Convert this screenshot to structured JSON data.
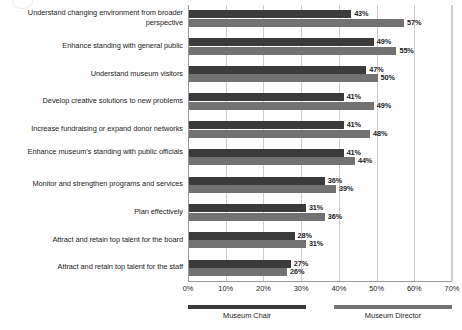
{
  "chart_data": {
    "type": "bar",
    "orientation": "horizontal",
    "title": "",
    "xlabel": "",
    "ylabel": "",
    "xlim": [
      0,
      70
    ],
    "xticks": [
      "0%",
      "10%",
      "20%",
      "30%",
      "40%",
      "50%",
      "60%",
      "70%"
    ],
    "grid": true,
    "legend_position": "bottom",
    "categories": [
      "Understand changing environment from broader perspective",
      "Enhance standing with general public",
      "Understand museum visitors",
      "Develop creative solutions to new problems",
      "Increase fundraising or expand donor networks",
      "Enhance museum's standing with public officials",
      "Monitor and strengthen programs and services",
      "Plan effectively",
      "Attract and retain top talent for the board",
      "Attract and retain top talent for the staff"
    ],
    "series": [
      {
        "name": "Museum Chair",
        "color": "#3b3b3b",
        "values": [
          43,
          49,
          47,
          41,
          41,
          41,
          36,
          31,
          28,
          27
        ],
        "labels": [
          "43%",
          "49%",
          "47%",
          "41%",
          "41%",
          "41%",
          "36%",
          "31%",
          "28%",
          "27%"
        ]
      },
      {
        "name": "Museum Director",
        "color": "#727272",
        "values": [
          57,
          55,
          50,
          49,
          48,
          44,
          39,
          36,
          31,
          26
        ],
        "labels": [
          "57%",
          "55%",
          "50%",
          "49%",
          "48%",
          "44%",
          "39%",
          "36%",
          "31%",
          "26%"
        ]
      }
    ]
  },
  "legend": [
    {
      "label": "Museum Chair",
      "color": "#3b3b3b"
    },
    {
      "label": "Museum Director",
      "color": "#727272"
    }
  ]
}
